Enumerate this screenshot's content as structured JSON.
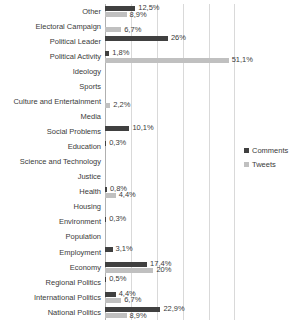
{
  "chart_data": {
    "type": "bar",
    "orientation": "horizontal",
    "title": "",
    "xlabel": "",
    "ylabel": "",
    "grid": true,
    "legend_position": "right",
    "xlim": [
      0,
      62
    ],
    "gridline_step_percent": 10.7,
    "colors": {
      "comments": "#404040",
      "tweets": "#c0c0c0",
      "gridline": "#d9d9d9",
      "text": "#3a3a3a"
    },
    "series": [
      {
        "name": "Comments",
        "key": "comments"
      },
      {
        "name": "Tweets",
        "key": "tweets"
      }
    ],
    "categories": [
      "Other",
      "Electoral Campaign",
      "Political Leader",
      "Political Activity",
      "Ideology",
      "Sports",
      "Culture and Entertainment",
      "Media",
      "Social Problems",
      "Education",
      "Science and Technology",
      "Justice",
      "Health",
      "Housing",
      "Environment",
      "Population",
      "Employment",
      "Economy",
      "Regional Politics",
      "International Politics",
      "National Politics"
    ],
    "rows": [
      {
        "category": "Other",
        "comments": 12.5,
        "tweets": 8.9,
        "comments_label": "12,5%",
        "tweets_label": "8,9%"
      },
      {
        "category": "Electoral Campaign",
        "comments": null,
        "tweets": 6.7,
        "comments_label": "",
        "tweets_label": "6,7%"
      },
      {
        "category": "Political Leader",
        "comments": 26,
        "tweets": null,
        "comments_label": "26%",
        "tweets_label": ""
      },
      {
        "category": "Political Activity",
        "comments": 1.8,
        "tweets": 51.1,
        "comments_label": "1,8%",
        "tweets_label": "51,1%"
      },
      {
        "category": "Ideology",
        "comments": null,
        "tweets": null,
        "comments_label": "",
        "tweets_label": ""
      },
      {
        "category": "Sports",
        "comments": null,
        "tweets": null,
        "comments_label": "",
        "tweets_label": ""
      },
      {
        "category": "Culture and Entertainment",
        "comments": null,
        "tweets": 2.2,
        "comments_label": "",
        "tweets_label": "2,2%"
      },
      {
        "category": "Media",
        "comments": null,
        "tweets": null,
        "comments_label": "",
        "tweets_label": ""
      },
      {
        "category": "Social Problems",
        "comments": 10.1,
        "tweets": null,
        "comments_label": "10,1%",
        "tweets_label": ""
      },
      {
        "category": "Education",
        "comments": 0.3,
        "tweets": null,
        "comments_label": "0,3%",
        "tweets_label": ""
      },
      {
        "category": "Science and Technology",
        "comments": null,
        "tweets": null,
        "comments_label": "",
        "tweets_label": ""
      },
      {
        "category": "Justice",
        "comments": null,
        "tweets": null,
        "comments_label": "",
        "tweets_label": ""
      },
      {
        "category": "Health",
        "comments": 0.8,
        "tweets": 4.4,
        "comments_label": "0,8%",
        "tweets_label": "4,4%"
      },
      {
        "category": "Housing",
        "comments": null,
        "tweets": null,
        "comments_label": "",
        "tweets_label": ""
      },
      {
        "category": "Environment",
        "comments": 0.3,
        "tweets": null,
        "comments_label": "0,3%",
        "tweets_label": ""
      },
      {
        "category": "Population",
        "comments": null,
        "tweets": null,
        "comments_label": "",
        "tweets_label": ""
      },
      {
        "category": "Employment",
        "comments": 3.1,
        "tweets": null,
        "comments_label": "3,1%",
        "tweets_label": ""
      },
      {
        "category": "Economy",
        "comments": 17.4,
        "tweets": 20,
        "comments_label": "17,4%",
        "tweets_label": "20%"
      },
      {
        "category": "Regional Politics",
        "comments": 0.5,
        "tweets": null,
        "comments_label": "0,5%",
        "tweets_label": ""
      },
      {
        "category": "International Politics",
        "comments": 4.4,
        "tweets": 6.7,
        "comments_label": "4,4%",
        "tweets_label": "6,7%"
      },
      {
        "category": "National Politics",
        "comments": 22.9,
        "tweets": 8.9,
        "comments_label": "22,9%",
        "tweets_label": "8,9%"
      }
    ]
  },
  "legend": {
    "items": [
      {
        "label": "Comments"
      },
      {
        "label": "Tweets"
      }
    ]
  }
}
